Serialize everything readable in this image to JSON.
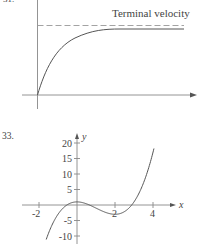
{
  "chart_data": [
    {
      "type": "line",
      "title": "",
      "xlabel": "",
      "ylabel": "",
      "annotations": [
        "Terminal velocity"
      ],
      "series": [
        {
          "name": "velocity",
          "description": "rises from origin, approaches horizontal asymptote",
          "x": [
            0,
            0.5,
            1,
            1.5,
            2,
            3,
            4,
            5
          ],
          "y": [
            0,
            0.45,
            0.7,
            0.84,
            0.92,
            0.98,
            1.0,
            1.0
          ]
        },
        {
          "name": "Terminal velocity",
          "style": "dashed",
          "x": [
            0,
            5
          ],
          "y": [
            1.05,
            1.05
          ]
        }
      ],
      "grid": false
    },
    {
      "type": "line",
      "label": "33.",
      "xlabel": "x",
      "ylabel": "y",
      "x_ticks": [
        "-2",
        "2",
        "4"
      ],
      "y_ticks": [
        "20",
        "15",
        "10",
        "5",
        "-5",
        "-10"
      ],
      "xlim": [
        -2.7,
        4.9
      ],
      "ylim": [
        -12.5,
        22
      ],
      "series": [
        {
          "name": "y = x^3 - 3x^2 + 1",
          "x": [
            -1.6,
            -1,
            0,
            1,
            2,
            3,
            4
          ],
          "y": [
            -10.8,
            -3,
            1,
            -1,
            -3,
            1,
            17
          ]
        }
      ],
      "grid": false
    }
  ],
  "top_graph": {
    "partial_label": "31.",
    "annotation": "Terminal velocity"
  },
  "bottom_graph": {
    "number_label": "33.",
    "x_axis_label": "x",
    "y_axis_label": "y",
    "x_tick_labels": [
      "-2",
      "2",
      "4"
    ],
    "y_tick_labels": [
      "20",
      "15",
      "10",
      "5",
      "-5",
      "-10"
    ]
  }
}
